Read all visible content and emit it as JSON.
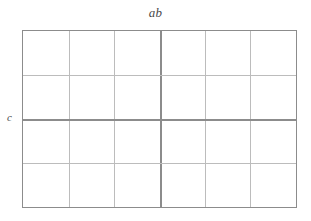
{
  "diagram": {
    "type": "factorial-design-grid",
    "title": "",
    "background_color": "#ffffff",
    "labels": {
      "top": "ab",
      "left": "c"
    },
    "grid": {
      "columns": 6,
      "rows": 4,
      "left_px": 22,
      "top_px": 30,
      "width_px": 275,
      "height_px": 178,
      "border_color": "#8c8c8c",
      "minor_line_color": "#bcbcbc",
      "major_line_color": "#8c8c8c",
      "major_column_divider_index": 3,
      "major_row_divider_index": 2,
      "cell_values": [
        [
          "",
          "",
          "",
          "",
          "",
          ""
        ],
        [
          "",
          "",
          "",
          "",
          "",
          ""
        ],
        [
          "",
          "",
          "",
          "",
          "",
          ""
        ],
        [
          "",
          "",
          "",
          "",
          "",
          ""
        ]
      ]
    }
  }
}
